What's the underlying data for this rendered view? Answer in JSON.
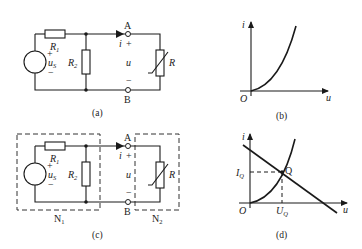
{
  "figure_a": {
    "caption": "(a)",
    "source_label": "u",
    "source_sub": "S",
    "source_plus": "+",
    "source_minus": "−",
    "r1_label": "R",
    "r1_sub": "1",
    "r2_label": "R",
    "r2_sub": "2",
    "r_label": "R",
    "node_a": "A",
    "node_b": "B",
    "current_label": "i",
    "voltage_label": "u",
    "plus": "+",
    "minus": "−"
  },
  "figure_b": {
    "caption": "(b)",
    "y_axis_label": "i",
    "x_axis_label": "u",
    "origin_label": "O"
  },
  "figure_c": {
    "caption": "(c)",
    "source_label": "u",
    "source_sub": "S",
    "source_plus": "+",
    "source_minus": "−",
    "r1_label": "R",
    "r1_sub": "1",
    "r2_label": "R",
    "r2_sub": "2",
    "r_label": "R",
    "node_a": "A",
    "node_b": "B",
    "current_label": "i",
    "voltage_label": "u",
    "plus": "+",
    "minus": "−",
    "n1_label": "N",
    "n1_sub": "1",
    "n2_label": "N",
    "n2_sub": "2"
  },
  "figure_d": {
    "caption": "(d)",
    "y_axis_label": "i",
    "x_axis_label": "u",
    "origin_label": "O",
    "iq_label": "I",
    "iq_sub": "Q",
    "uq_label": "U",
    "uq_sub": "Q",
    "q_label": "Q"
  }
}
